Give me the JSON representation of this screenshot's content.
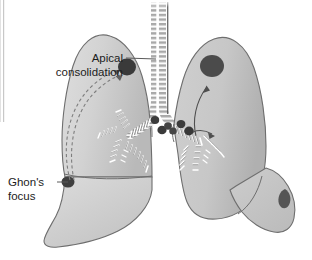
{
  "figure": {
    "type": "medical-illustration",
    "width": 312,
    "height": 260
  },
  "labels": [
    {
      "id": "apical-consolidation",
      "line1": "Apical",
      "line2": "consolidation",
      "text_anchor_x": 123,
      "text_y1": 62,
      "text_y2": 76,
      "leader_from": [
        126,
        58
      ],
      "leader_to": [
        154,
        58
      ],
      "points_to": [
        158,
        60
      ]
    },
    {
      "id": "ghons-focus",
      "line1": "Ghon's",
      "line2": "focus",
      "text_anchor_x": 58,
      "text_y1": 186,
      "text_y2": 200,
      "leader_from": [
        60,
        182
      ],
      "leader_to": [
        72,
        182
      ],
      "points_to": [
        76,
        183
      ]
    }
  ],
  "lesions": [
    {
      "id": "left-apical-consolidation",
      "cx": 127,
      "cy": 67,
      "rx": 9,
      "ry": 8.5,
      "shade": "#3a3a3a"
    },
    {
      "id": "right-apical-consolidation",
      "cx": 212,
      "cy": 66,
      "rx": 12,
      "ry": 11,
      "shade": "#494949"
    },
    {
      "id": "ghons-focus-lesion",
      "cx": 68,
      "cy": 182,
      "rx": 6.5,
      "ry": 5.5,
      "shade": "#3f3f3f"
    },
    {
      "id": "right-lower-lesion",
      "cx": 285,
      "cy": 198,
      "rx": 7,
      "ry": 9,
      "shade": "#555555"
    }
  ],
  "lymph_nodes": [
    {
      "id": "hilar-node-left-upper",
      "cx": 155,
      "cy": 120,
      "r": 4.2
    },
    {
      "id": "hilar-node-left-mid",
      "cx": 161,
      "cy": 130,
      "r": 4.6
    },
    {
      "id": "hilar-node-left-lower",
      "cx": 167,
      "cy": 127,
      "r": 4.0
    },
    {
      "id": "hilar-node-right-upper",
      "cx": 182,
      "cy": 125,
      "r": 4.4
    },
    {
      "id": "hilar-node-right-mid",
      "cx": 189,
      "cy": 131,
      "r": 4.8
    },
    {
      "id": "hilar-node-right-lower",
      "cx": 197,
      "cy": 137,
      "r": 4.2
    }
  ],
  "arrows": [
    {
      "id": "spread-dashed-ghon-to-apex-outer",
      "style": "dashed",
      "description": "lymphohaematogenous spread from Ghon's focus to apex"
    },
    {
      "id": "spread-dashed-ghon-to-apex-inner",
      "style": "dashed",
      "description": "second dashed spread path"
    },
    {
      "id": "spread-solid-hilum-to-apex",
      "style": "solid",
      "description": "spread from hilum to right apex"
    },
    {
      "id": "spread-solid-hilum-lateral",
      "style": "solid",
      "description": "lateral spread at right hilum"
    }
  ],
  "anatomy": {
    "trachea": "trachea-with-cartilage-rings",
    "left_lung": "left-lung-silhouette",
    "right_lung": "right-lung-silhouette",
    "bronchial_tree": "bronchial-tree-branches",
    "fissure": "oblique-fissure"
  },
  "colors": {
    "background": "#ffffff",
    "lung_fill_light": "#d7d7d7",
    "lung_fill_mid": "#c9c9c9",
    "lung_fill_dark": "#b4b4b4",
    "outline": "#6b6b6b",
    "lesion_dark": "#3a3a3a",
    "text": "#1c1c1c",
    "bronchi_light": "#f2f2f2",
    "bronchi_shadow": "#9a9a9a"
  }
}
